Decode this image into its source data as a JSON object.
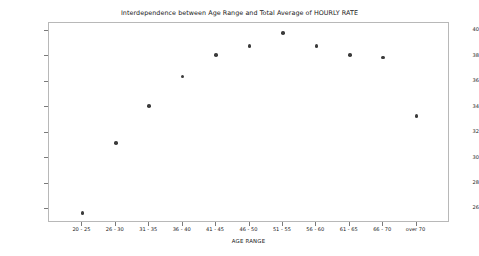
{
  "chart_data": {
    "type": "scatter",
    "title": "Interdependence between Age Range and Total Average of HOURLY RATE",
    "xlabel": "AGE RANGE",
    "ylabel": "Total Average of HOURLY RATE",
    "categories": [
      "20 - 25",
      "26 - 30",
      "31 - 35",
      "36 - 40",
      "41 - 45",
      "46 - 50",
      "51 - 55",
      "56 - 60",
      "61 - 65",
      "66 - 70",
      "over 70"
    ],
    "values": [
      25.7,
      31.2,
      34.1,
      36.4,
      38.1,
      38.8,
      39.8,
      38.8,
      38.1,
      37.9,
      33.3
    ],
    "yticks": [
      26,
      28,
      30,
      32,
      34,
      36,
      38,
      40
    ],
    "ylim": [
      24.9,
      40.6
    ],
    "grid": false,
    "legend": null,
    "marker_color": "#3b3b3b"
  }
}
